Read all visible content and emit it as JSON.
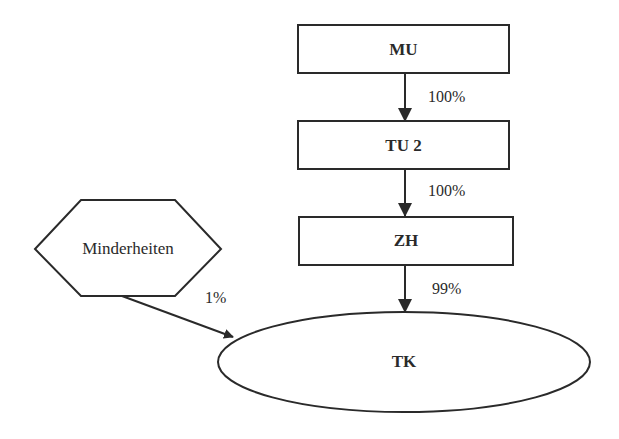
{
  "diagram": {
    "nodes": [
      {
        "id": "mu",
        "label": "MU",
        "shape": "rectangle"
      },
      {
        "id": "tu2",
        "label": "TU 2",
        "shape": "rectangle"
      },
      {
        "id": "zh",
        "label": "ZH",
        "shape": "rectangle"
      },
      {
        "id": "minderheiten",
        "label": "Minderheiten",
        "shape": "hexagon"
      },
      {
        "id": "tk",
        "label": "TK",
        "shape": "ellipse"
      }
    ],
    "edges": [
      {
        "from": "mu",
        "to": "tu2",
        "label": "100%"
      },
      {
        "from": "tu2",
        "to": "zh",
        "label": "100%"
      },
      {
        "from": "zh",
        "to": "tk",
        "label": "99%"
      },
      {
        "from": "minderheiten",
        "to": "tk",
        "label": "1%"
      }
    ]
  }
}
